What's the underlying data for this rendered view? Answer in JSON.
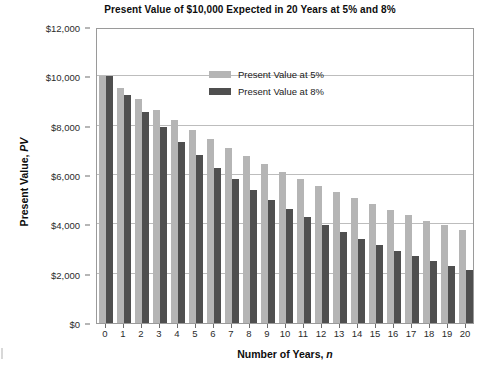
{
  "chart_data": {
    "type": "bar",
    "title": "Present Value of $10,000 Expected in 20 Years at 5% and 8%",
    "xlabel_prefix": "Number of Years, ",
    "xlabel_symbol": "n",
    "ylabel_prefix": "Present Value, ",
    "ylabel_symbol": "PV",
    "categories": [
      "0",
      "1",
      "2",
      "3",
      "4",
      "5",
      "6",
      "7",
      "8",
      "9",
      "10",
      "11",
      "12",
      "13",
      "14",
      "15",
      "16",
      "17",
      "18",
      "19",
      "20"
    ],
    "x": [
      0,
      1,
      2,
      3,
      4,
      5,
      6,
      7,
      8,
      9,
      10,
      11,
      12,
      13,
      14,
      15,
      16,
      17,
      18,
      19,
      20
    ],
    "series": [
      {
        "name": "Present Value at 5%",
        "color": "#b5b5b5",
        "values": [
          10000,
          9524,
          9070,
          8638,
          8227,
          7835,
          7462,
          7107,
          6768,
          6446,
          6139,
          5847,
          5568,
          5303,
          5051,
          4810,
          4581,
          4363,
          4155,
          3957,
          3769
        ]
      },
      {
        "name": "Present Value at 8%",
        "color": "#4f4f4f",
        "values": [
          10000,
          9259,
          8573,
          7938,
          7350,
          6806,
          6302,
          5835,
          5403,
          5002,
          4632,
          4289,
          3971,
          3677,
          3405,
          3152,
          2919,
          2703,
          2502,
          2317,
          2145
        ]
      }
    ],
    "ylim": [
      0,
      12000
    ],
    "ytick_values": [
      0,
      2000,
      4000,
      6000,
      8000,
      10000,
      12000
    ],
    "ytick_labels": [
      "$0",
      "$2,000",
      "$4,000",
      "$6,000",
      "$8,000",
      "$10,000",
      "$12,000"
    ],
    "grid": "horizontal",
    "legend_position": "top-left-inside",
    "plot_border": true,
    "axis_color": "#9a9a9a",
    "grid_color": "#bdbdbd"
  }
}
